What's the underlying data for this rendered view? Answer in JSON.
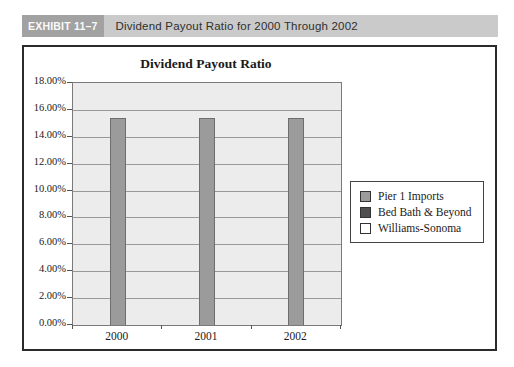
{
  "exhibit": {
    "number": "EXHIBIT 11–7",
    "title": "Dividend Payout Ratio for 2000 Through 2002"
  },
  "chart_data": {
    "type": "bar",
    "title": "Dividend Payout Ratio",
    "categories": [
      "2000",
      "2001",
      "2002"
    ],
    "series": [
      {
        "name": "Pier 1 Imports",
        "color": "#9b9b9b",
        "values": [
          15.4,
          15.4,
          15.4
        ]
      },
      {
        "name": "Bed Bath & Beyond",
        "color": "#4f4f4f",
        "values": [
          0,
          0,
          0
        ]
      },
      {
        "name": "Williams-Sonoma",
        "color": "#ffffff",
        "values": [
          0,
          0,
          0
        ]
      }
    ],
    "xlabel": "",
    "ylabel": "",
    "ylim": [
      0,
      18
    ],
    "ytick_step": 2,
    "ytick_format": "percent_2dp",
    "grid": "horizontal",
    "legend_position": "right",
    "plot_background": "#ececec",
    "bar_border_color": "#6e6e6e"
  }
}
